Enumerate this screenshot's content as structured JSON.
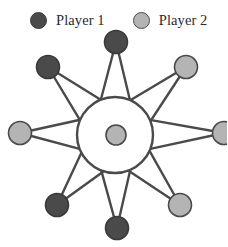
{
  "figure": {
    "title": "",
    "width": 227,
    "height": 247,
    "background": "#ffffff"
  },
  "legend": {
    "entries": [
      {
        "label": "Player 1",
        "color": "#4a4a4a",
        "stroke": "#3a3a3a",
        "icon": "filled-circle-icon"
      },
      {
        "label": "Player 2",
        "color": "#b4b4b4",
        "stroke": "#4a4a4a",
        "icon": "filled-circle-icon"
      }
    ]
  },
  "graph": {
    "type": "star-wheel-graph",
    "edge_color": "#4a4a4a",
    "edge_width": 2.4,
    "hub": {
      "name": "hub-circle",
      "cx": 115,
      "cy": 135,
      "r": 38,
      "fill": "#ffffff",
      "stroke": "#4a4a4a",
      "stroke_width": 2.4
    },
    "center_node": {
      "name": "center-node",
      "cx": 116,
      "cy": 135,
      "r": 10,
      "player": "Player 2",
      "fill": "#b4b4b4",
      "stroke": "#4a4a4a"
    },
    "outer_nodes": [
      {
        "id": "node-top",
        "cx": 116,
        "cy": 42,
        "r": 11.5,
        "player": "Player 1",
        "fill": "#4a4a4a",
        "stroke": "#3a3a3a",
        "angle": -90
      },
      {
        "id": "node-top-right",
        "cx": 186,
        "cy": 67,
        "r": 11.5,
        "player": "Player 2",
        "fill": "#b4b4b4",
        "stroke": "#4a4a4a",
        "angle": -45
      },
      {
        "id": "node-right",
        "cx": 224,
        "cy": 133,
        "r": 11.5,
        "player": "Player 2",
        "fill": "#b4b4b4",
        "stroke": "#4a4a4a",
        "angle": 0
      },
      {
        "id": "node-bottom-right",
        "cx": 180,
        "cy": 205,
        "r": 11.5,
        "player": "Player 2",
        "fill": "#b4b4b4",
        "stroke": "#4a4a4a",
        "angle": 45
      },
      {
        "id": "node-bottom",
        "cx": 117,
        "cy": 228,
        "r": 11.5,
        "player": "Player 1",
        "fill": "#4a4a4a",
        "stroke": "#3a3a3a",
        "angle": 90
      },
      {
        "id": "node-bottom-left",
        "cx": 57,
        "cy": 205,
        "r": 11.5,
        "player": "Player 1",
        "fill": "#4a4a4a",
        "stroke": "#3a3a3a",
        "angle": 135
      },
      {
        "id": "node-left",
        "cx": 20,
        "cy": 133,
        "r": 11.5,
        "player": "Player 2",
        "fill": "#b4b4b4",
        "stroke": "#4a4a4a",
        "angle": 180
      },
      {
        "id": "node-top-left",
        "cx": 48,
        "cy": 67,
        "r": 11.5,
        "player": "Player 1",
        "fill": "#4a4a4a",
        "stroke": "#3a3a3a",
        "angle": -135
      }
    ],
    "spoke_count": 8,
    "node_count": 9
  }
}
